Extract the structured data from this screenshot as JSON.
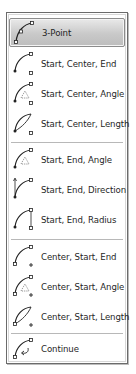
{
  "menu": {
    "items": [
      {
        "label": "3-Point",
        "icon": "arc-3point-icon",
        "highlighted": true
      },
      {
        "label": "Start, Center, End",
        "icon": "arc-start-center-end-icon"
      },
      {
        "label": "Start, Center, Angle",
        "icon": "arc-start-center-angle-icon"
      },
      {
        "label": "Start, Center, Length",
        "icon": "arc-start-center-length-icon"
      },
      {
        "label": "Start, End, Angle",
        "icon": "arc-start-end-angle-icon"
      },
      {
        "label": "Start, End, Direction",
        "icon": "arc-start-end-direction-icon"
      },
      {
        "label": "Start, End, Radius",
        "icon": "arc-start-end-radius-icon"
      },
      {
        "label": "Center, Start, End",
        "icon": "arc-center-start-end-icon"
      },
      {
        "label": "Center, Start, Angle",
        "icon": "arc-center-start-angle-icon"
      },
      {
        "label": "Center, Start, Length",
        "icon": "arc-center-start-length-icon"
      },
      {
        "label": "Continue",
        "icon": "arc-continue-icon"
      }
    ]
  },
  "colors": {
    "border": "#6b6b6b",
    "highlight_top": "#e9e9e9",
    "highlight_bottom": "#bdbdbd",
    "separator": "#b8b8b8",
    "text": "#1f1f1f"
  }
}
